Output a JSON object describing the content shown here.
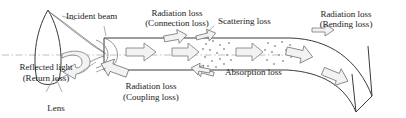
{
  "figure": {
    "colors": {
      "stroke": "#3a3a3a",
      "text": "#1a1a1a",
      "arrow_fill": "#f0f0f0",
      "arrow_stroke": "#6e6e6e",
      "axis": "#9a9a9a",
      "scatter_dot": "#8a8a8a"
    }
  },
  "labels": {
    "incident_beam": "Incident beam",
    "radiation_loss_connection_line1": "Radiation loss",
    "radiation_loss_connection_line2": "(Connection loss)",
    "scattering_loss": "Scattering loss",
    "radiation_loss_bending_line1": "Radiation loss",
    "radiation_loss_bending_line2": "(Bending loss)",
    "reflected_light_line1": "Reflected light",
    "reflected_light_line2": "(Return loss)",
    "lens": "Lens",
    "radiation_loss_coupling_line1": "Radiation loss",
    "radiation_loss_coupling_line2": "(Coupling loss)",
    "absorption_loss": "Absorption loss"
  },
  "elements": {
    "lens_shape": "lens",
    "fiber_core": "fiber-waveguide",
    "optical_axis": "dash-dot-axis",
    "propagation_arrows": 4,
    "loss_arrows": 6,
    "scatter_clusters": 3
  }
}
